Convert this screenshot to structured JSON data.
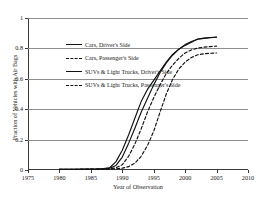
{
  "chart_data": {
    "type": "line",
    "title": "",
    "xlabel": "Year of Observation",
    "ylabel": "Fraction of Vehicles with Air Bags",
    "xlim": [
      1975,
      2010
    ],
    "ylim": [
      0,
      1
    ],
    "xticks": [
      "1975",
      "1980",
      "1985",
      "1990",
      "1995",
      "2000",
      "2005",
      "2010"
    ],
    "yticks": [
      "0",
      "0.2",
      "0.4",
      "0.6",
      "0.8",
      "1"
    ],
    "grid": "horizontal",
    "legend_position": "top-left-inside",
    "x": [
      1980,
      1982,
      1984,
      1986,
      1987,
      1988,
      1989,
      1990,
      1991,
      1992,
      1993,
      1994,
      1995,
      1996,
      1997,
      1998,
      1999,
      2000,
      2001,
      2002,
      2003,
      2004,
      2005
    ],
    "series": [
      {
        "name": "Cars, Driver's Side",
        "style": "solid",
        "color": "#111111",
        "values": [
          0.005,
          0.005,
          0.006,
          0.008,
          0.01,
          0.015,
          0.055,
          0.13,
          0.23,
          0.34,
          0.45,
          0.53,
          0.59,
          0.65,
          0.71,
          0.76,
          0.795,
          0.82,
          0.84,
          0.862,
          0.868,
          0.872,
          0.875
        ]
      },
      {
        "name": "Cars, Passenger's Side",
        "style": "dashed",
        "color": "#111111",
        "values": [
          0.004,
          0.004,
          0.005,
          0.006,
          0.007,
          0.009,
          0.014,
          0.035,
          0.09,
          0.17,
          0.27,
          0.38,
          0.475,
          0.56,
          0.635,
          0.69,
          0.735,
          0.77,
          0.79,
          0.802,
          0.808,
          0.812,
          0.815
        ]
      },
      {
        "name": "SUVs & Light Trucks, Driver's Side",
        "style": "solid",
        "color": "#111111",
        "values": [
          0.004,
          0.004,
          0.005,
          0.006,
          0.008,
          0.012,
          0.03,
          0.085,
          0.175,
          0.275,
          0.38,
          0.47,
          0.56,
          0.64,
          0.705,
          0.755,
          0.795,
          0.825,
          0.845,
          0.86,
          0.866,
          0.87,
          0.873
        ]
      },
      {
        "name": "SUVs & Light Trucks, Passenger's Side",
        "style": "dashed",
        "color": "#111111",
        "values": [
          0.003,
          0.003,
          0.004,
          0.004,
          0.005,
          0.006,
          0.008,
          0.012,
          0.022,
          0.045,
          0.09,
          0.16,
          0.255,
          0.38,
          0.5,
          0.595,
          0.665,
          0.71,
          0.74,
          0.758,
          0.765,
          0.768,
          0.77
        ]
      }
    ]
  }
}
